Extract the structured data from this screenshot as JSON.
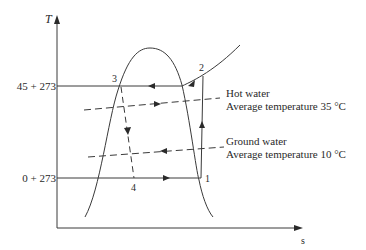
{
  "diagram": {
    "axes": {
      "y_label": "T",
      "x_label": "s"
    },
    "levels": {
      "upper": "45 + 273",
      "lower": "0 + 273"
    },
    "points": {
      "p1": "1",
      "p2": "2",
      "p3": "3",
      "p4": "4"
    },
    "annotations": {
      "hot_water_title": "Hot water",
      "hot_water_temp": "Average temperature 35 °C",
      "ground_water_title": "Ground water",
      "ground_water_temp": "Average temperature 10 °C"
    },
    "colors": {
      "line": "#3a3a3a",
      "text": "#2a2a2a"
    }
  }
}
